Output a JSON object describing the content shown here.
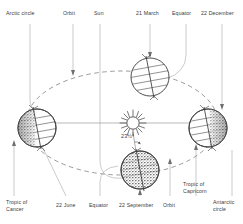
{
  "diagram": {
    "background_color": "#ffffff",
    "ink_color": "#3a3a3a",
    "leader_line_color": "#9a9a9a",
    "axis_tilt": {
      "value": "23½°",
      "name": "axial-tilt-annotation"
    },
    "labels": {
      "arctic_circle": "Arctic circle",
      "orbit_top": "Orbit",
      "sun": "Sun",
      "march": "21 March",
      "equator_top": "Equator",
      "december": "22 December",
      "tropic_of_cancer_line1": "Tropic of",
      "tropic_of_cancer_line2": "Cancer",
      "june": "22 June",
      "equator_bottom": "Equator",
      "september": "22 September",
      "orbit_bottom": "Orbit",
      "tropic_of_capricorn_line1": "Tropic of",
      "tropic_of_capricorn_line2": "Capricorn",
      "antarctic_circle_line1": "Antarctic",
      "antarctic_circle_line2": "circle"
    },
    "bodies": [
      {
        "name": "earth-21-march",
        "label": "21 March",
        "shading": "none",
        "cx": 150,
        "cy": 77,
        "r": 19
      },
      {
        "name": "earth-22-december",
        "label": "22 December",
        "shading": "right",
        "cx": 208,
        "cy": 128,
        "r": 19
      },
      {
        "name": "earth-22-september",
        "label": "22 September",
        "shading": "stipple",
        "cx": 140,
        "cy": 170,
        "r": 19
      },
      {
        "name": "earth-22-june",
        "label": "22 June",
        "shading": "left",
        "cx": 37,
        "cy": 128,
        "r": 19
      },
      {
        "name": "sun-center",
        "label": "Sun",
        "shading": "rays",
        "cx": 133,
        "cy": 123,
        "r": 7
      }
    ]
  }
}
